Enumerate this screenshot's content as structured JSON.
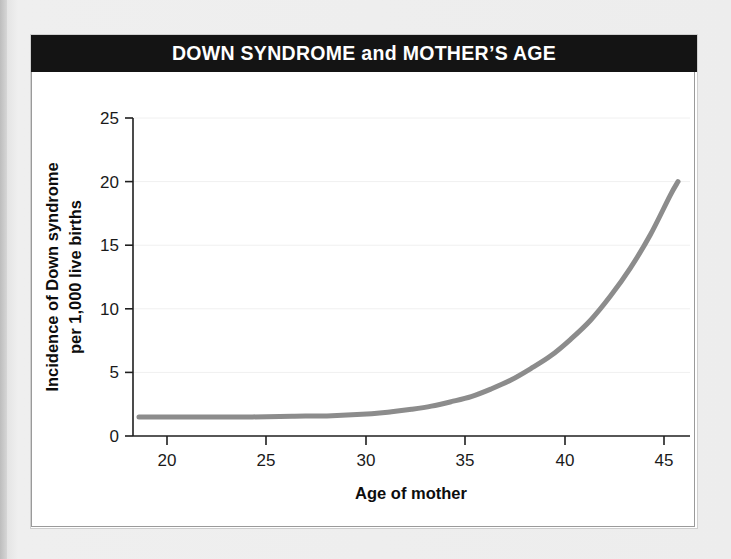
{
  "figure": {
    "title": "DOWN SYNDROME and MOTHER’S AGE",
    "title_bar_color": "#141414",
    "title_text_color": "#ffffff",
    "card_background": "#ffffff",
    "page_background": "#e9e9e9"
  },
  "chart_data": {
    "type": "line",
    "title": "DOWN SYNDROME and MOTHER’S AGE",
    "xlabel": "Age of mother",
    "ylabel": "Incidence of Down syndrome per 1,000 live births",
    "ylabel_line1": "Incidence of Down syndrome",
    "ylabel_line2": "per 1,000 live births",
    "xlim": [
      18,
      46
    ],
    "ylim": [
      0,
      25
    ],
    "xticks": [
      20,
      25,
      30,
      35,
      40,
      45
    ],
    "yticks": [
      0,
      5,
      10,
      15,
      20,
      25
    ],
    "xtick_labels": [
      "20",
      "25",
      "30",
      "35",
      "40",
      "45"
    ],
    "ytick_labels": [
      "0",
      "5",
      "10",
      "15",
      "20",
      "25"
    ],
    "grid": "horizontal-faint",
    "legend": "none",
    "series": [
      {
        "name": "Incidence of Down syndrome per 1,000 live births",
        "color": "#8c8c8c",
        "line_width": 5,
        "x": [
          18.3,
          20,
          22,
          24,
          26,
          28,
          30,
          31,
          32,
          33,
          34,
          35,
          36,
          37,
          38,
          39,
          40,
          41,
          42,
          43,
          44,
          45,
          45.4
        ],
        "y": [
          1.5,
          1.5,
          1.5,
          1.5,
          1.55,
          1.6,
          1.75,
          1.9,
          2.1,
          2.35,
          2.7,
          3.1,
          3.7,
          4.4,
          5.3,
          6.3,
          7.6,
          9.1,
          11.0,
          13.2,
          15.8,
          18.9,
          20.0
        ]
      }
    ]
  },
  "axes": {
    "x_axis_title": "Age of mother",
    "y_axis_title_line1": "Incidence of Down syndrome",
    "y_axis_title_line2": "per 1,000 live births"
  }
}
